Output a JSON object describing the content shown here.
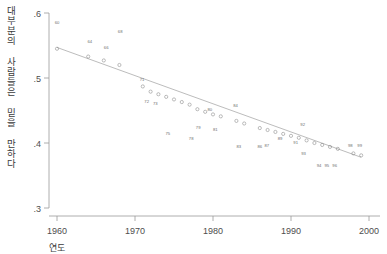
{
  "chart_data": {
    "type": "scatter",
    "title": "",
    "xlabel": "연도",
    "ylabel": "대부분의 사람들은 믿을 만하다",
    "xlim": [
      1958,
      2001
    ],
    "ylim": [
      0.3,
      0.6
    ],
    "xticks": [
      "1960",
      "1970",
      "1980",
      "1990",
      "2000"
    ],
    "xtick_values": [
      1960,
      1970,
      1980,
      1990,
      2000
    ],
    "yticks": [
      ".6",
      ".5",
      ".4",
      ".3"
    ],
    "ytick_values": [
      0.6,
      0.5,
      0.4,
      0.3
    ],
    "grid": false,
    "legend": false,
    "point_label_style": "two-digit-year",
    "series": [
      {
        "name": "대부분의 사람들은 믿을 만하다",
        "x": [
          1960,
          1964,
          1966,
          1968,
          1971,
          1972,
          1973,
          1974,
          1975,
          1976,
          1977,
          1978,
          1979,
          1980,
          1981,
          1983,
          1984,
          1986,
          1987,
          1988,
          1989,
          1990,
          1991,
          1992,
          1993,
          1994,
          1995,
          1996,
          1998,
          1999
        ],
        "labels": [
          "60",
          "64",
          "66",
          "68",
          "71",
          "72",
          "73",
          "74",
          "75",
          "76",
          "77",
          "78",
          "79",
          "80",
          "81",
          "83",
          "84",
          "86",
          "87",
          "88",
          "89",
          "90",
          "91",
          "92",
          "93",
          "94",
          "95",
          "96",
          "98",
          "99"
        ],
        "values": [
          0.545,
          0.533,
          0.527,
          0.52,
          0.487,
          0.479,
          0.475,
          0.471,
          0.467,
          0.463,
          0.459,
          0.452,
          0.448,
          0.444,
          0.441,
          0.434,
          0.43,
          0.423,
          0.42,
          0.417,
          0.414,
          0.411,
          0.408,
          0.404,
          0.4,
          0.397,
          0.394,
          0.391,
          0.384,
          0.381
        ]
      }
    ],
    "trendline": {
      "x_start": 1960,
      "y_start": 0.547,
      "x_end": 1999,
      "y_end": 0.378
    },
    "annotations": [
      {
        "text": "60",
        "x": 1960,
        "y": 0.583
      },
      {
        "text": "64",
        "x": 1964.2,
        "y": 0.554
      },
      {
        "text": "66",
        "x": 1966.3,
        "y": 0.545
      },
      {
        "text": "68",
        "x": 1968.1,
        "y": 0.57
      },
      {
        "text": "71",
        "x": 1970.9,
        "y": 0.495
      },
      {
        "text": "72",
        "x": 1971.5,
        "y": 0.461
      },
      {
        "text": "73",
        "x": 1972.6,
        "y": 0.458
      },
      {
        "text": "75",
        "x": 1974.2,
        "y": 0.412
      },
      {
        "text": "78",
        "x": 1977.2,
        "y": 0.405
      },
      {
        "text": "79",
        "x": 1978.1,
        "y": 0.421
      },
      {
        "text": "80",
        "x": 1979.6,
        "y": 0.449
      },
      {
        "text": "81",
        "x": 1980.3,
        "y": 0.418
      },
      {
        "text": "83",
        "x": 1983.3,
        "y": 0.393
      },
      {
        "text": "84",
        "x": 1982.9,
        "y": 0.455
      },
      {
        "text": "86",
        "x": 1986.0,
        "y": 0.392
      },
      {
        "text": "87",
        "x": 1986.9,
        "y": 0.394
      },
      {
        "text": "89",
        "x": 1988.6,
        "y": 0.404
      },
      {
        "text": "91",
        "x": 1990.6,
        "y": 0.399
      },
      {
        "text": "92",
        "x": 1991.5,
        "y": 0.426
      },
      {
        "text": "93",
        "x": 1991.6,
        "y": 0.382
      },
      {
        "text": "94",
        "x": 1993.6,
        "y": 0.363
      },
      {
        "text": "95",
        "x": 1994.6,
        "y": 0.363
      },
      {
        "text": "96",
        "x": 1995.6,
        "y": 0.363
      },
      {
        "text": "98",
        "x": 1997.6,
        "y": 0.394
      },
      {
        "text": "99",
        "x": 1998.8,
        "y": 0.394
      }
    ]
  }
}
